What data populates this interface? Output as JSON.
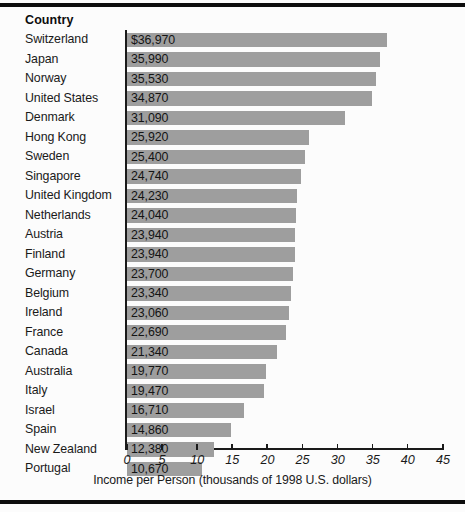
{
  "figure": {
    "column_header": "Country",
    "axis_caption": "Income per Person (thousands of 1998 U.S. dollars)"
  },
  "chart_data": {
    "type": "bar",
    "orientation": "horizontal",
    "title": "",
    "xlabel": "Income per Person (thousands of 1998 U.S. dollars)",
    "ylabel": "Country",
    "xlim": [
      0,
      45
    ],
    "xticks": [
      0,
      5,
      10,
      15,
      20,
      25,
      30,
      35,
      40,
      45
    ],
    "xtick_labels": [
      "0",
      "5",
      "10",
      "15",
      "20",
      "25",
      "30",
      "35",
      "40",
      "45"
    ],
    "grid": false,
    "legend": "none",
    "bar_color": "#9e9e9e",
    "value_unit": "thousands of 1998 U.S. dollars",
    "categories": [
      "Switzerland",
      "Japan",
      "Norway",
      "United States",
      "Denmark",
      "Hong Kong",
      "Sweden",
      "Singapore",
      "United Kingdom",
      "Netherlands",
      "Austria",
      "Finland",
      "Germany",
      "Belgium",
      "Ireland",
      "France",
      "Canada",
      "Australia",
      "Italy",
      "Israel",
      "Spain",
      "New Zealand",
      "Portugal"
    ],
    "values": [
      36.97,
      35.99,
      35.53,
      34.87,
      31.09,
      25.92,
      25.4,
      24.74,
      24.23,
      24.04,
      23.94,
      23.94,
      23.7,
      23.34,
      23.06,
      22.69,
      21.34,
      19.77,
      19.47,
      16.71,
      14.86,
      12.38,
      10.67
    ],
    "value_labels": [
      "$36,970",
      "35,990",
      "35,530",
      "34,870",
      "31,090",
      "25,920",
      "25,400",
      "24,740",
      "24,230",
      "24,040",
      "23,940",
      "23,940",
      "23,700",
      "23,340",
      "23,060",
      "22,690",
      "21,340",
      "19,770",
      "19,470",
      "16,710",
      "14,860",
      "12,380",
      "10,670"
    ]
  }
}
